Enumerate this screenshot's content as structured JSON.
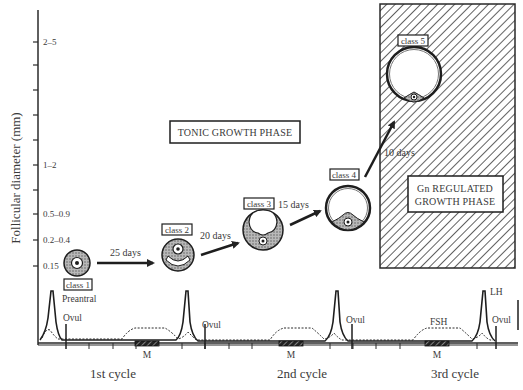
{
  "figure": {
    "y_axis": {
      "label": "Follicular diameter (mm)",
      "ticks": [
        {
          "label": "2–5",
          "y": 42
        },
        {
          "label": "",
          "y": 65
        },
        {
          "label": "",
          "y": 90
        },
        {
          "label": "",
          "y": 115
        },
        {
          "label": "",
          "y": 140
        },
        {
          "label": "1–2",
          "y": 165
        },
        {
          "label": "",
          "y": 190
        },
        {
          "label": "0.5–0.9",
          "y": 214
        },
        {
          "label": "0.2–0.4",
          "y": 240
        },
        {
          "label": "0.15",
          "y": 266
        }
      ]
    },
    "phases": {
      "tonic": "TONIC GROWTH PHASE",
      "gn_line1": "Gn REGULATED",
      "gn_line2": "GROWTH PHASE"
    },
    "follicles": [
      {
        "class_label": "class 1",
        "stage_label": "Preantral"
      },
      {
        "class_label": "class 2"
      },
      {
        "class_label": "class 3"
      },
      {
        "class_label": "class 4"
      },
      {
        "class_label": "class 5"
      }
    ],
    "transitions": [
      {
        "label": "25 days"
      },
      {
        "label": "20 days"
      },
      {
        "label": "15 days"
      },
      {
        "label": "10 days"
      }
    ],
    "hormone_profile": {
      "ovulation_label": "Ovul",
      "menses_label": "M",
      "fsh_label": "FSH",
      "lh_label": "LH"
    },
    "cycles": [
      "1st cycle",
      "2nd cycle",
      "3rd cycle"
    ],
    "colors": {
      "ink": "#2a2a2a",
      "hatch": "#3a3a3a",
      "granulosa_fill": "#9a9a9a",
      "background": "#ffffff"
    }
  }
}
